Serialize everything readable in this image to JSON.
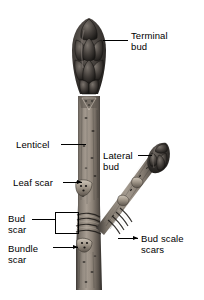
{
  "figure": {
    "background_color": "#ffffff",
    "ink_color": "#000000"
  },
  "labels": [
    {
      "id": "terminal-bud",
      "text": "Terminal\nbud",
      "align": "left"
    },
    {
      "id": "lenticel",
      "text": "Lenticel",
      "align": "left"
    },
    {
      "id": "lateral-bud",
      "text": "Lateral\nbud",
      "align": "left"
    },
    {
      "id": "leaf-scar",
      "text": "Leaf scar",
      "align": "left"
    },
    {
      "id": "bud-scar",
      "text": "Bud\nscar",
      "align": "left"
    },
    {
      "id": "bundle-scar",
      "text": "Bundle\nscar",
      "align": "left"
    },
    {
      "id": "bud-scale-scars",
      "text": "Bud scale\nscars",
      "align": "left"
    }
  ],
  "specimen": {
    "parts": [
      "terminal-bud",
      "main-stem",
      "lateral-branch",
      "lateral-bud",
      "leaf-scar",
      "bundle-scar",
      "bud-scale-scar-rings",
      "lenticels"
    ]
  }
}
